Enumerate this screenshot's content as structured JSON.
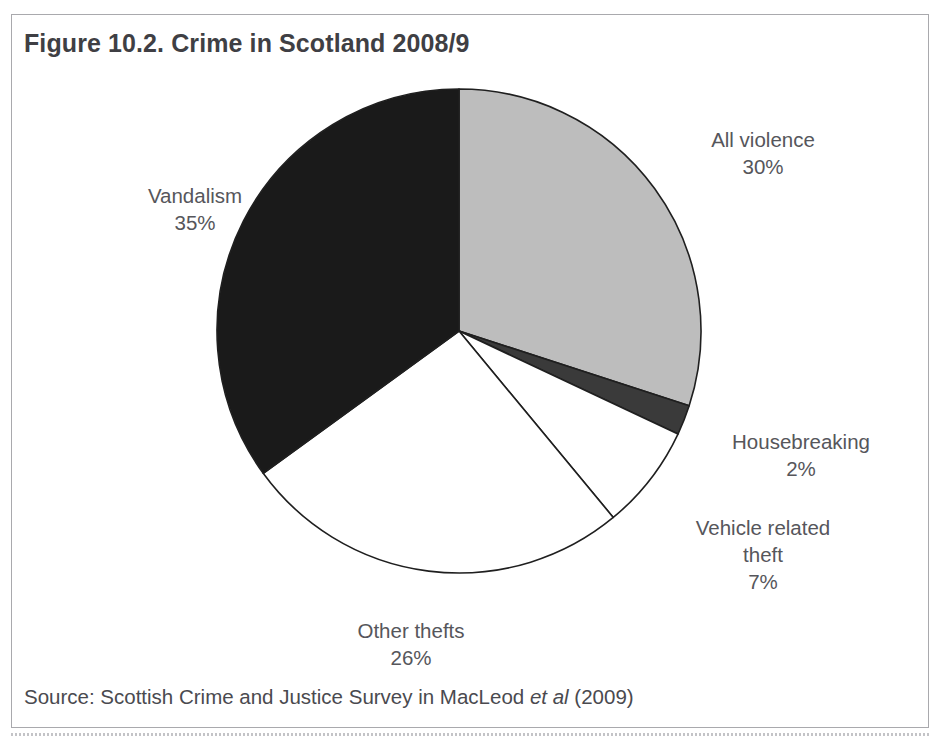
{
  "figure": {
    "title": "Figure 10.2. Crime in Scotland 2008/9",
    "source_prefix": "Source: Scottish Crime and Justice Survey in MacLeod ",
    "source_italic": "et al",
    "source_suffix": " (2009)"
  },
  "chart_data": {
    "type": "pie",
    "title": "Figure 10.2. Crime in Scotland 2008/9",
    "xlabel": "",
    "ylabel": "",
    "unit": "%",
    "start_angle_deg": 0,
    "direction": "clockwise",
    "legend": "none (direct labels outside slices)",
    "grid": false,
    "categories": [
      "All violence",
      "Housebreaking",
      "Vehicle related theft",
      "Other thefts",
      "Vandalism"
    ],
    "values": [
      30,
      2,
      7,
      26,
      35
    ],
    "colors": [
      "#bdbdbd",
      "#3a3a3a",
      "#ffffff",
      "#ffffff",
      "#1a1a1a"
    ],
    "slices": [
      {
        "label": "All violence",
        "value": 30,
        "value_text": "30%",
        "color": "#bdbdbd"
      },
      {
        "label": "Housebreaking",
        "value": 2,
        "value_text": "2%",
        "color": "#3a3a3a"
      },
      {
        "label": "Vehicle related theft",
        "value": 7,
        "value_text": "7%",
        "color": "#ffffff"
      },
      {
        "label": "Other thefts",
        "value": 26,
        "value_text": "26%",
        "color": "#ffffff"
      },
      {
        "label": "Vandalism",
        "value": 35,
        "value_text": "35%",
        "color": "#1a1a1a"
      }
    ]
  },
  "labels": {
    "all_violence": {
      "name": "All violence",
      "value": "30%"
    },
    "vandalism": {
      "name": "Vandalism",
      "value": "35%"
    },
    "housebreaking": {
      "name": "Housebreaking",
      "value": "2%"
    },
    "vehicle_theft": {
      "name": "Vehicle related",
      "name2": "theft",
      "value": "7%"
    },
    "other_thefts": {
      "name": "Other thefts",
      "value": "26%"
    }
  },
  "style": {
    "slice_stroke": "#1f1f1f",
    "text_color": "#56565b",
    "title_color": "#3f3f44",
    "frame_color": "#a9a9ad",
    "background": "#ffffff"
  }
}
